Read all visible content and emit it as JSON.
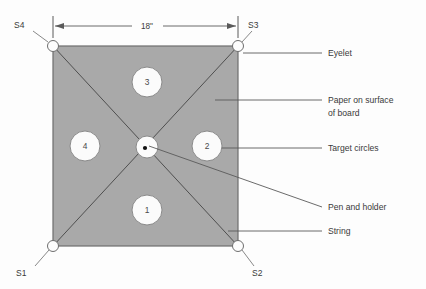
{
  "diagram": {
    "colors": {
      "paper_fill": "#a9a9a9",
      "paper_stroke": "#6e6e6e",
      "line": "#5a5a5a",
      "circle_fill": "#fbfbfb",
      "circle_stroke": "#8a8a8a",
      "text": "#3a3a3a",
      "background": "#fdfdfd",
      "pen_dot": "#111111"
    },
    "dimension": {
      "label": "18\"",
      "name": "board-width-dimension"
    },
    "corner_labels": [
      {
        "id": "s4",
        "text": "S4",
        "x": 14,
        "y": 28
      },
      {
        "id": "s3",
        "text": "S3",
        "x": 248,
        "y": 28
      },
      {
        "id": "s1",
        "text": "S1",
        "x": 16,
        "y": 276
      },
      {
        "id": "s2",
        "text": "S2",
        "x": 252,
        "y": 276
      }
    ],
    "target_circles": [
      {
        "id": "circle-1",
        "label": "1",
        "cx": 147,
        "cy": 210,
        "r": 15
      },
      {
        "id": "circle-2",
        "label": "2",
        "cx": 207,
        "cy": 146,
        "r": 15
      },
      {
        "id": "circle-3",
        "label": "3",
        "cx": 147,
        "cy": 82,
        "r": 15
      },
      {
        "id": "circle-4",
        "label": "4",
        "cx": 85,
        "cy": 146,
        "r": 15
      }
    ],
    "center_target": {
      "id": "pen-holder-circle",
      "cx": 147,
      "cy": 147,
      "r": 11
    },
    "eyelets": [
      {
        "id": "eyelet-s4",
        "cx": 53,
        "cy": 46,
        "r": 5.5
      },
      {
        "id": "eyelet-s3",
        "cx": 238,
        "cy": 46,
        "r": 5.5
      },
      {
        "id": "eyelet-s1",
        "cx": 53,
        "cy": 246,
        "r": 5.5
      },
      {
        "id": "eyelet-s2",
        "cx": 238,
        "cy": 246,
        "r": 5.5
      }
    ],
    "callouts": [
      {
        "id": "callout-eyelet",
        "text": "Eyelet",
        "x": 328,
        "y": 56
      },
      {
        "id": "callout-paper-line1",
        "text": "Paper on surface",
        "x": 328,
        "y": 103
      },
      {
        "id": "callout-paper-line2",
        "text": "of board",
        "x": 328,
        "y": 116
      },
      {
        "id": "callout-target-circles",
        "text": "Target circles",
        "x": 328,
        "y": 151
      },
      {
        "id": "callout-pen-holder",
        "text": "Pen and holder",
        "x": 328,
        "y": 210
      },
      {
        "id": "callout-string",
        "text": "String",
        "x": 328,
        "y": 234
      }
    ]
  }
}
